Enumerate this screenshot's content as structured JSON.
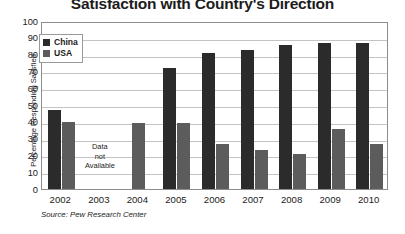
{
  "chart_data": {
    "type": "bar",
    "title": "Satisfaction with Country's Direction",
    "xlabel": "",
    "ylabel": "Percentage Responding Satisfied",
    "ylim": [
      0,
      100
    ],
    "yticks": [
      0,
      10,
      20,
      30,
      40,
      50,
      60,
      70,
      80,
      90,
      100
    ],
    "grid": true,
    "legend_position": "inside-upper-left",
    "categories": [
      "2002",
      "2003",
      "2004",
      "2005",
      "2006",
      "2007",
      "2008",
      "2009",
      "2010"
    ],
    "series": [
      {
        "name": "China",
        "color": "#2b2b2b",
        "values": [
          47,
          null,
          null,
          72,
          81,
          83,
          86,
          87,
          87
        ]
      },
      {
        "name": "USA",
        "color": "#5c5c5c",
        "values": [
          40,
          null,
          39,
          39,
          27,
          23,
          21,
          36,
          27
        ]
      }
    ],
    "annotations": [
      {
        "text_lines": [
          "Data",
          "not",
          "Available"
        ],
        "category": "2003"
      }
    ],
    "source": "Source: Pew Research Center"
  },
  "legend": {
    "items": [
      {
        "label": "China",
        "color": "#2b2b2b"
      },
      {
        "label": "USA",
        "color": "#5c5c5c"
      }
    ]
  },
  "colors": {
    "china": "#2b2b2b",
    "usa": "#5c5c5c",
    "grid": "#c4c4c4",
    "frame": "#8d8d8d",
    "text": "#1c1c1c",
    "background": "#ffffff"
  }
}
